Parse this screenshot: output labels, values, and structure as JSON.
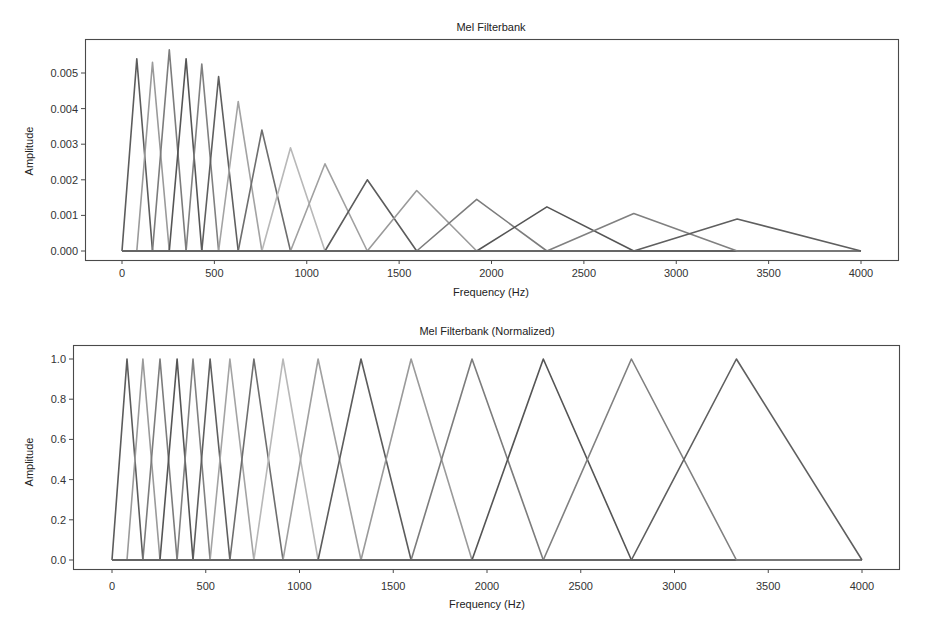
{
  "chart_data": [
    {
      "type": "line",
      "title": "Mel Filterbank",
      "xlabel": "Frequency (Hz)",
      "ylabel": "Amplitude",
      "xlim": [
        -200,
        4200
      ],
      "ylim": [
        0,
        0.0058
      ],
      "grid": false,
      "legend": null,
      "xticks": [
        0,
        500,
        1000,
        1500,
        2000,
        2500,
        3000,
        3500,
        4000
      ],
      "xtick_labels": [
        "0",
        "500",
        "1000",
        "1500",
        "2000",
        "2500",
        "3000",
        "3500",
        "4000"
      ],
      "yticks": [
        0,
        0.001,
        0.002,
        0.003,
        0.004,
        0.005
      ],
      "ytick_labels": [
        "0.000",
        "0.001",
        "0.002",
        "0.003",
        "0.004",
        "0.005"
      ],
      "filter_edges_hz": [
        0,
        80,
        165,
        256,
        347,
        432,
        523,
        629,
        757,
        912,
        1099,
        1328,
        1595,
        1920,
        2300,
        2770,
        3330,
        4000
      ],
      "series": [
        {
          "name": "filter 1",
          "x": [
            0,
            80,
            165
          ],
          "y": [
            0,
            0.0054,
            0
          ]
        },
        {
          "name": "filter 2",
          "x": [
            80,
            165,
            256
          ],
          "y": [
            0,
            0.0053,
            0
          ]
        },
        {
          "name": "filter 3",
          "x": [
            165,
            256,
            347
          ],
          "y": [
            0,
            0.00565,
            0
          ]
        },
        {
          "name": "filter 4",
          "x": [
            256,
            347,
            432
          ],
          "y": [
            0,
            0.0054,
            0
          ]
        },
        {
          "name": "filter 5",
          "x": [
            347,
            432,
            523
          ],
          "y": [
            0,
            0.00525,
            0
          ]
        },
        {
          "name": "filter 6",
          "x": [
            432,
            523,
            629
          ],
          "y": [
            0,
            0.0049,
            0
          ]
        },
        {
          "name": "filter 7",
          "x": [
            523,
            629,
            757
          ],
          "y": [
            0,
            0.0042,
            0
          ]
        },
        {
          "name": "filter 8",
          "x": [
            629,
            757,
            912
          ],
          "y": [
            0,
            0.0034,
            0
          ]
        },
        {
          "name": "filter 9",
          "x": [
            757,
            912,
            1099
          ],
          "y": [
            0,
            0.0029,
            0
          ]
        },
        {
          "name": "filter 10",
          "x": [
            912,
            1099,
            1328
          ],
          "y": [
            0,
            0.00245,
            0
          ]
        },
        {
          "name": "filter 11",
          "x": [
            1099,
            1328,
            1595
          ],
          "y": [
            0,
            0.002,
            0
          ]
        },
        {
          "name": "filter 12",
          "x": [
            1328,
            1595,
            1920
          ],
          "y": [
            0,
            0.0017,
            0
          ]
        },
        {
          "name": "filter 13",
          "x": [
            1595,
            1920,
            2300
          ],
          "y": [
            0,
            0.00145,
            0
          ]
        },
        {
          "name": "filter 14",
          "x": [
            1920,
            2300,
            2770
          ],
          "y": [
            0,
            0.00124,
            0
          ]
        },
        {
          "name": "filter 15",
          "x": [
            2300,
            2770,
            3330
          ],
          "y": [
            0,
            0.00105,
            0
          ]
        },
        {
          "name": "filter 16",
          "x": [
            2770,
            3330,
            4000
          ],
          "y": [
            0,
            0.0009,
            0
          ]
        }
      ]
    },
    {
      "type": "line",
      "title": "Mel Filterbank (Normalized)",
      "xlabel": "Frequency (Hz)",
      "ylabel": "Amplitude",
      "xlim": [
        -200,
        4200
      ],
      "ylim": [
        -0.05,
        1.05
      ],
      "grid": false,
      "legend": null,
      "xticks": [
        0,
        500,
        1000,
        1500,
        2000,
        2500,
        3000,
        3500,
        4000
      ],
      "xtick_labels": [
        "0",
        "500",
        "1000",
        "1500",
        "2000",
        "2500",
        "3000",
        "3500",
        "4000"
      ],
      "yticks": [
        0,
        0.2,
        0.4,
        0.6,
        0.8,
        1.0
      ],
      "ytick_labels": [
        "0.0",
        "0.2",
        "0.4",
        "0.6",
        "0.8",
        "1.0"
      ],
      "filter_edges_hz": [
        0,
        80,
        165,
        256,
        347,
        432,
        523,
        629,
        757,
        912,
        1099,
        1328,
        1595,
        1920,
        2300,
        2770,
        3330,
        4000
      ],
      "series": [
        {
          "name": "filter 1",
          "x": [
            0,
            80,
            165
          ],
          "y": [
            0,
            1,
            0
          ]
        },
        {
          "name": "filter 2",
          "x": [
            80,
            165,
            256
          ],
          "y": [
            0,
            1,
            0
          ]
        },
        {
          "name": "filter 3",
          "x": [
            165,
            256,
            347
          ],
          "y": [
            0,
            1,
            0
          ]
        },
        {
          "name": "filter 4",
          "x": [
            256,
            347,
            432
          ],
          "y": [
            0,
            1,
            0
          ]
        },
        {
          "name": "filter 5",
          "x": [
            347,
            432,
            523
          ],
          "y": [
            0,
            1,
            0
          ]
        },
        {
          "name": "filter 6",
          "x": [
            432,
            523,
            629
          ],
          "y": [
            0,
            1,
            0
          ]
        },
        {
          "name": "filter 7",
          "x": [
            523,
            629,
            757
          ],
          "y": [
            0,
            1,
            0
          ]
        },
        {
          "name": "filter 8",
          "x": [
            629,
            757,
            912
          ],
          "y": [
            0,
            1,
            0
          ]
        },
        {
          "name": "filter 9",
          "x": [
            757,
            912,
            1099
          ],
          "y": [
            0,
            1,
            0
          ]
        },
        {
          "name": "filter 10",
          "x": [
            912,
            1099,
            1328
          ],
          "y": [
            0,
            1,
            0
          ]
        },
        {
          "name": "filter 11",
          "x": [
            1099,
            1328,
            1595
          ],
          "y": [
            0,
            1,
            0
          ]
        },
        {
          "name": "filter 12",
          "x": [
            1328,
            1595,
            1920
          ],
          "y": [
            0,
            1,
            0
          ]
        },
        {
          "name": "filter 13",
          "x": [
            1595,
            1920,
            2300
          ],
          "y": [
            0,
            1,
            0
          ]
        },
        {
          "name": "filter 14",
          "x": [
            1920,
            2300,
            2770
          ],
          "y": [
            0,
            1,
            0
          ]
        },
        {
          "name": "filter 15",
          "x": [
            2300,
            2770,
            3330
          ],
          "y": [
            0,
            1,
            0
          ]
        },
        {
          "name": "filter 16",
          "x": [
            2770,
            3330,
            4000
          ],
          "y": [
            0,
            1,
            0
          ]
        }
      ]
    }
  ],
  "style": {
    "line_colors": [
      "#5c5c5c",
      "#9a9a9a",
      "#7c7c7c",
      "#555555",
      "#808080",
      "#5f5f5f",
      "#a3a3a3",
      "#6e6e6e",
      "#b8b8b8",
      "#a0a0a0"
    ],
    "baseline_color": "#4f4f4f",
    "frame_color": "#4a4a4a"
  }
}
